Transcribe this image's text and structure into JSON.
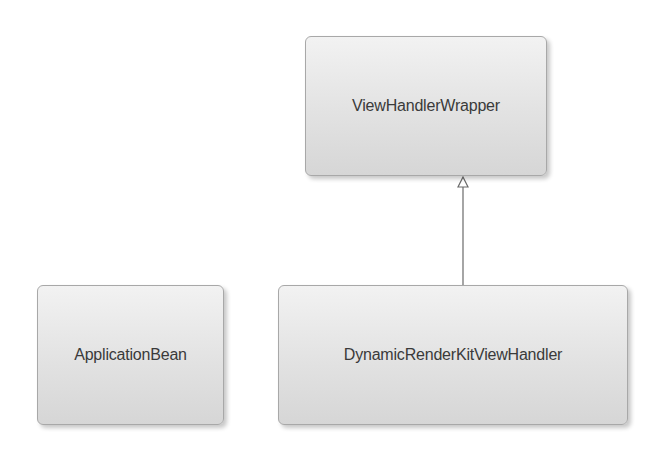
{
  "diagram": {
    "type": "uml-class-diagram",
    "classes": [
      {
        "id": "viewhandlerwrapper",
        "name": "ViewHandlerWrapper"
      },
      {
        "id": "applicationbean",
        "name": "ApplicationBean"
      },
      {
        "id": "dynamicrenderkit",
        "name": "DynamicRenderKitViewHandler"
      }
    ],
    "relations": [
      {
        "from": "DynamicRenderKitViewHandler",
        "to": "ViewHandlerWrapper",
        "kind": "generalization"
      }
    ]
  }
}
